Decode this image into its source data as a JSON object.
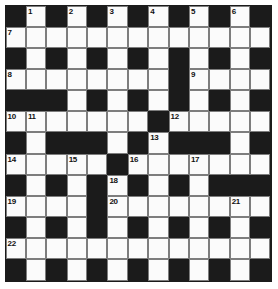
{
  "puzzle": {
    "title": "Crossword Grid",
    "rows": 13,
    "cols": 13,
    "colors": {
      "block": "#1b1b1b",
      "cell": "#fbfbfb",
      "rule": "#7d7d7d",
      "number": "#111111",
      "background": "#ffffff"
    },
    "grid": [
      [
        "B",
        "W",
        "B",
        "W",
        "B",
        "W",
        "B",
        "W",
        "B",
        "W",
        "B",
        "W",
        "B"
      ],
      [
        "W",
        "W",
        "W",
        "W",
        "W",
        "W",
        "W",
        "W",
        "W",
        "W",
        "W",
        "W",
        "W"
      ],
      [
        "B",
        "W",
        "B",
        "W",
        "B",
        "W",
        "B",
        "W",
        "B",
        "W",
        "B",
        "W",
        "B"
      ],
      [
        "W",
        "W",
        "W",
        "W",
        "W",
        "W",
        "W",
        "W",
        "B",
        "W",
        "W",
        "W",
        "W"
      ],
      [
        "B",
        "B",
        "B",
        "W",
        "B",
        "W",
        "B",
        "W",
        "B",
        "W",
        "B",
        "W",
        "B"
      ],
      [
        "W",
        "W",
        "W",
        "W",
        "W",
        "W",
        "W",
        "B",
        "W",
        "W",
        "W",
        "W",
        "W"
      ],
      [
        "B",
        "W",
        "B",
        "B",
        "B",
        "W",
        "B",
        "W",
        "B",
        "B",
        "B",
        "W",
        "B"
      ],
      [
        "W",
        "W",
        "W",
        "W",
        "W",
        "B",
        "W",
        "W",
        "W",
        "W",
        "W",
        "W",
        "W"
      ],
      [
        "B",
        "W",
        "B",
        "W",
        "B",
        "W",
        "B",
        "W",
        "B",
        "W",
        "B",
        "B",
        "B"
      ],
      [
        "W",
        "W",
        "W",
        "W",
        "B",
        "W",
        "W",
        "W",
        "W",
        "W",
        "W",
        "W",
        "W"
      ],
      [
        "B",
        "W",
        "B",
        "W",
        "B",
        "W",
        "B",
        "W",
        "B",
        "W",
        "B",
        "W",
        "B"
      ],
      [
        "W",
        "W",
        "W",
        "W",
        "W",
        "W",
        "W",
        "W",
        "W",
        "W",
        "W",
        "W",
        "W"
      ],
      [
        "B",
        "W",
        "B",
        "W",
        "B",
        "W",
        "B",
        "W",
        "B",
        "W",
        "B",
        "W",
        "B"
      ]
    ],
    "numbers": [
      {
        "row": 0,
        "col": 1,
        "n": "1"
      },
      {
        "row": 0,
        "col": 3,
        "n": "2"
      },
      {
        "row": 0,
        "col": 5,
        "n": "3"
      },
      {
        "row": 0,
        "col": 7,
        "n": "4"
      },
      {
        "row": 0,
        "col": 9,
        "n": "5"
      },
      {
        "row": 0,
        "col": 11,
        "n": "6"
      },
      {
        "row": 1,
        "col": 0,
        "n": "7"
      },
      {
        "row": 3,
        "col": 0,
        "n": "8"
      },
      {
        "row": 3,
        "col": 9,
        "n": "9"
      },
      {
        "row": 5,
        "col": 0,
        "n": "10"
      },
      {
        "row": 5,
        "col": 1,
        "n": "11"
      },
      {
        "row": 5,
        "col": 8,
        "n": "12"
      },
      {
        "row": 6,
        "col": 7,
        "n": "13"
      },
      {
        "row": 7,
        "col": 0,
        "n": "14"
      },
      {
        "row": 7,
        "col": 3,
        "n": "15"
      },
      {
        "row": 7,
        "col": 6,
        "n": "16"
      },
      {
        "row": 7,
        "col": 9,
        "n": "17"
      },
      {
        "row": 8,
        "col": 5,
        "n": "18"
      },
      {
        "row": 9,
        "col": 0,
        "n": "19"
      },
      {
        "row": 9,
        "col": 5,
        "n": "20"
      },
      {
        "row": 9,
        "col": 11,
        "n": "21"
      },
      {
        "row": 11,
        "col": 0,
        "n": "22"
      }
    ]
  }
}
